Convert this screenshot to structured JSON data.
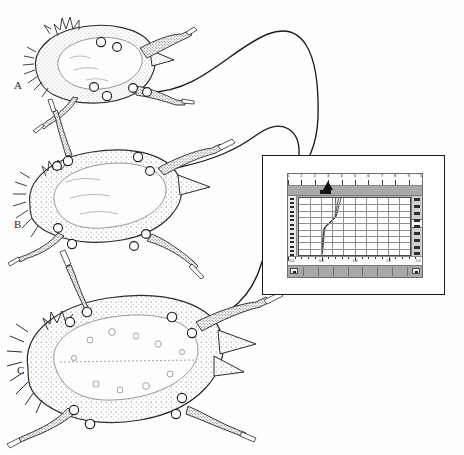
{
  "figure": {
    "caption_labels": [
      "A",
      "B",
      "C"
    ],
    "marker_symbol": "open-circle",
    "ink_color": "#262626",
    "background": "#ffffff"
  },
  "specimens": [
    {
      "id": "A",
      "label": "A",
      "label_x": 14,
      "label_y": 86,
      "marker_count": 6,
      "markers": [
        [
          101,
          42
        ],
        [
          117,
          47
        ],
        [
          88,
          86
        ],
        [
          105,
          96
        ],
        [
          133,
          87
        ],
        [
          146,
          93
        ]
      ]
    },
    {
      "id": "B",
      "label": "B",
      "label_x": 14,
      "label_y": 225,
      "marker_count": 6,
      "markers": [
        [
          68,
          161
        ],
        [
          57,
          164
        ],
        [
          138,
          157
        ],
        [
          147,
          171
        ],
        [
          55,
          230
        ],
        [
          72,
          244
        ],
        [
          146,
          236
        ],
        [
          133,
          246
        ]
      ]
    },
    {
      "id": "C",
      "label": "C",
      "label_x": 17,
      "label_y": 372,
      "marker_count": 6,
      "markers": [
        [
          87,
          312
        ],
        [
          69,
          321
        ],
        [
          170,
          317
        ],
        [
          190,
          333
        ],
        [
          73,
          412
        ],
        [
          89,
          424
        ],
        [
          181,
          399
        ],
        [
          176,
          414
        ]
      ]
    }
  ],
  "cables": {
    "count": 3,
    "description": "tethers from each specimen to the recording monitor",
    "color": "#1b1b1b"
  },
  "monitor": {
    "name": "data-acquisition-display",
    "frame_color": "#1a1a1a",
    "bezel_color": "#ffffff",
    "screen_bg": "#b9b9b9",
    "plot_bg": "#ffffff",
    "grid_color": "#8f8f8f",
    "toolbar_color": "#a8a8a8",
    "trace_color": "#3a3a3a"
  },
  "window": {
    "top_ruler": {
      "name": "horizontal-ruler",
      "labels": [
        "0",
        "1",
        "2",
        "3",
        "4",
        "5",
        "6",
        "7",
        "8",
        "9",
        "10"
      ],
      "tick_count": 11
    },
    "bottom_ruler": {
      "name": "bottom-scale",
      "labels": [
        "0.0",
        "0.5",
        "1.0",
        "1.5",
        "2.0"
      ],
      "tick_count": 21
    },
    "left_ruler": {
      "name": "vertical-ruler",
      "tick_count": 14
    },
    "vertical_scrollbar": {
      "name": "vertical-scrollbar",
      "marker_count": 9,
      "thumb_top_pct": 38,
      "thumb_height_pct": 12
    },
    "horizontal_scrollbar": {
      "name": "horizontal-scrollbar",
      "left_button": "left-arrow",
      "right_button": "right-arrow",
      "segment_count": 9
    },
    "cursor": {
      "name": "playhead-cursor",
      "position_value": "3.4"
    }
  },
  "chart_data": {
    "type": "line",
    "title": "",
    "xlabel": "",
    "ylabel": "",
    "xlim": [
      0,
      10
    ],
    "ylim": [
      0,
      9
    ],
    "grid": true,
    "legend": false,
    "x_ticks": [
      0,
      1,
      2,
      3,
      4,
      5,
      6,
      7,
      8,
      9,
      10
    ],
    "y_ticks": [
      0,
      1,
      2,
      3,
      4,
      5,
      6,
      7,
      8,
      9
    ],
    "orientation": "vertical-trace",
    "series": [
      {
        "name": "trace-1",
        "x": [
          3.55,
          3.5,
          3.45,
          3.4,
          3.35,
          3.3,
          3.1,
          2.7,
          2.35,
          2.25,
          2.2,
          2.18,
          2.15,
          2.12,
          2.1,
          2.05
        ],
        "y": [
          9.0,
          8.4,
          7.8,
          7.2,
          6.6,
          6.1,
          5.6,
          5.0,
          4.4,
          3.9,
          3.2,
          2.5,
          1.9,
          1.3,
          0.7,
          0.15
        ]
      },
      {
        "name": "trace-2",
        "x": [
          3.78,
          3.7,
          3.6,
          3.52,
          3.44,
          3.34,
          3.12,
          2.74,
          2.4,
          2.3,
          2.26,
          2.23,
          2.2,
          2.17,
          2.14,
          2.1
        ],
        "y": [
          9.0,
          8.4,
          7.8,
          7.2,
          6.6,
          6.1,
          5.6,
          5.0,
          4.4,
          3.9,
          3.2,
          2.5,
          1.9,
          1.3,
          0.7,
          0.15
        ]
      },
      {
        "name": "trace-3",
        "x": [
          3.3,
          3.3,
          3.32,
          3.3,
          3.27,
          3.24,
          3.05,
          2.66,
          2.3,
          2.2,
          2.16,
          2.14,
          2.11,
          2.08,
          2.06,
          2.02
        ],
        "y": [
          9.0,
          8.4,
          7.8,
          7.2,
          6.6,
          6.1,
          5.6,
          5.0,
          4.4,
          3.9,
          3.2,
          2.5,
          1.9,
          1.3,
          0.7,
          0.15
        ]
      }
    ]
  }
}
